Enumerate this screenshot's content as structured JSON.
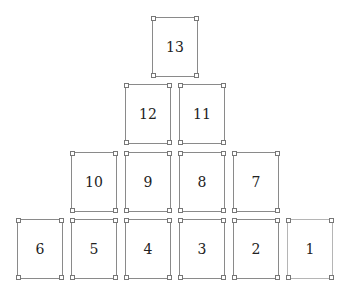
{
  "diagram": {
    "type": "pyramid-card-layout",
    "cards": [
      {
        "label": "13",
        "row": 1
      },
      {
        "label": "12",
        "row": 2
      },
      {
        "label": "11",
        "row": 2
      },
      {
        "label": "10",
        "row": 3
      },
      {
        "label": "9",
        "row": 3
      },
      {
        "label": "8",
        "row": 3
      },
      {
        "label": "7",
        "row": 3
      },
      {
        "label": "6",
        "row": 4
      },
      {
        "label": "5",
        "row": 4
      },
      {
        "label": "4",
        "row": 4
      },
      {
        "label": "3",
        "row": 4
      },
      {
        "label": "2",
        "row": 4
      },
      {
        "label": "1",
        "row": 4
      }
    ]
  }
}
